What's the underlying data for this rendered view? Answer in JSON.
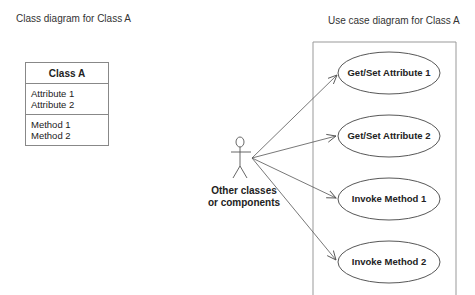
{
  "left_panel": {
    "title": "Class diagram for Class A",
    "class": {
      "name": "Class A",
      "attributes": [
        "Attribute 1",
        "Attribute 2"
      ],
      "methods": [
        "Method 1",
        "Method 2"
      ]
    }
  },
  "right_panel": {
    "title": "Use case diagram for Class A",
    "actor": {
      "label_line1": "Other classes",
      "label_line2": "or components",
      "icon": "stick-figure-actor-icon"
    },
    "use_cases": [
      {
        "label": "Get/Set Attribute 1"
      },
      {
        "label": "Get/Set Attribute 2"
      },
      {
        "label": "Invoke Method 1"
      },
      {
        "label": "Invoke Method 2"
      }
    ]
  },
  "colors": {
    "line": "#555555",
    "box_border": "#888888",
    "text": "#222222"
  }
}
